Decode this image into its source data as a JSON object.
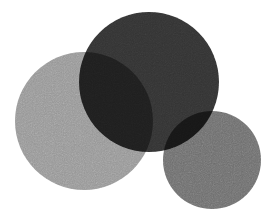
{
  "figure": {
    "background_color": "#ffffff",
    "width": 277,
    "height": 219,
    "texture": "grain",
    "blend_mode": "multiply"
  },
  "chart_data": {
    "type": "scatter",
    "subtitle": "",
    "xlabel": "",
    "ylabel": "",
    "xlim": [
      0,
      277
    ],
    "ylim": [
      0,
      219
    ],
    "grid": false,
    "legend_position": "none",
    "background_color": "#ffffff",
    "blend_mode": "multiply",
    "shapes": [
      {
        "name": "light-gray-circle",
        "role": "left circle",
        "cx": 84,
        "cy": 121,
        "r": 69,
        "diameter": 138,
        "fill": "#969696",
        "opacity": 1,
        "z": 1
      },
      {
        "name": "dark-circle",
        "role": "top right circle",
        "cx": 149,
        "cy": 82,
        "r": 70,
        "diameter": 140,
        "fill": "#333333",
        "opacity": 1,
        "z": 2
      },
      {
        "name": "medium-gray-circle",
        "role": "bottom right circle",
        "cx": 212,
        "cy": 160,
        "r": 49,
        "diameter": 98,
        "fill": "#6e6e6e",
        "opacity": 1,
        "z": 3
      }
    ],
    "overlap_colors": [
      {
        "name": "light-and-dark-overlap",
        "members": [
          "light-gray-circle",
          "dark-circle"
        ],
        "fill": "#5e5e5e"
      },
      {
        "name": "dark-and-medium-overlap",
        "members": [
          "dark-circle",
          "medium-gray-circle"
        ],
        "fill": "#555555"
      }
    ],
    "palette": {
      "light_gray": "#969696",
      "dark_gray": "#333333",
      "medium_gray": "#6e6e6e",
      "light_dark_overlap": "#5e5e5e",
      "dark_medium_overlap": "#555555",
      "background": "#ffffff"
    }
  }
}
